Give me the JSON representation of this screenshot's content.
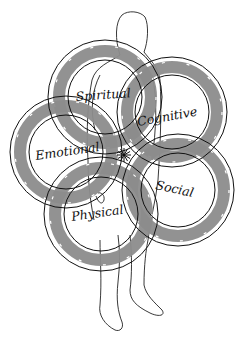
{
  "diagram": {
    "colors": {
      "band": "#8c8c8c",
      "line": "#111111",
      "figure": "#222222",
      "background": "#ffffff"
    },
    "center_star": {
      "x": 124,
      "y": 155
    },
    "rings": [
      {
        "id": "spiritual",
        "label": "Spiritual",
        "cx": 105,
        "cy": 97,
        "r_outer": 57,
        "r_inner": 37,
        "band_r": 46,
        "band_w": 12,
        "label_x": 76,
        "label_y": 101,
        "label_rot": -4
      },
      {
        "id": "cognitive",
        "label": "Cognitive",
        "cx": 172,
        "cy": 112,
        "r_outer": 55,
        "r_inner": 37,
        "band_r": 45,
        "band_w": 12,
        "label_x": 138,
        "label_y": 126,
        "label_rot": -10
      },
      {
        "id": "emotional",
        "label": "Emotional",
        "cx": 66,
        "cy": 152,
        "r_outer": 56,
        "r_inner": 37,
        "band_r": 46,
        "band_w": 12,
        "label_x": 36,
        "label_y": 160,
        "label_rot": -8
      },
      {
        "id": "social",
        "label": "Social",
        "cx": 178,
        "cy": 190,
        "r_outer": 56,
        "r_inner": 37,
        "band_r": 46,
        "band_w": 12,
        "label_x": 155,
        "label_y": 189,
        "label_rot": 12
      },
      {
        "id": "physical",
        "label": "Physical",
        "cx": 101,
        "cy": 214,
        "r_outer": 57,
        "r_inner": 37,
        "band_r": 46,
        "band_w": 12,
        "label_x": 72,
        "label_y": 221,
        "label_rot": -8
      }
    ]
  }
}
